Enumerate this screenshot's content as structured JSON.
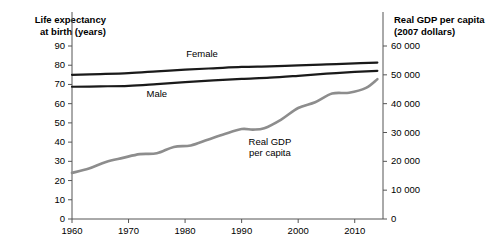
{
  "chart_data": {
    "type": "line",
    "title": "",
    "subtitle": "",
    "xlabel": "",
    "ylabel": "Life expectancy at birth (years)",
    "y2label": "Real GDP per capita (2007 dollars)",
    "xlim": [
      1960,
      2015
    ],
    "ylim": [
      0,
      90
    ],
    "y2lim": [
      0,
      60000
    ],
    "grid": false,
    "legend_position": "inline-annotations",
    "xticks": [
      1960,
      1970,
      1980,
      1990,
      2000,
      2010
    ],
    "xtick_labels": [
      "1960",
      "1970",
      "1980",
      "1990",
      "2000",
      "2010"
    ],
    "yticks": [
      0,
      10,
      20,
      30,
      40,
      50,
      60,
      70,
      80,
      90
    ],
    "ytick_labels": [
      "0",
      "10",
      "20",
      "30",
      "40",
      "50",
      "60",
      "70",
      "80",
      "90"
    ],
    "y2ticks": [
      0,
      10000,
      20000,
      30000,
      40000,
      50000,
      60000
    ],
    "y2tick_labels": [
      "0",
      "10 000",
      "20 000",
      "30 000",
      "40 000",
      "50 000",
      "60 000"
    ],
    "series": [
      {
        "name": "Female",
        "axis": "left",
        "color": "#1a1a1a",
        "width": 2.2,
        "x": [
          1960,
          1965,
          1970,
          1975,
          1980,
          1985,
          1990,
          1995,
          2000,
          2005,
          2010,
          2014
        ],
        "values": [
          75.0,
          75.4,
          75.9,
          76.8,
          77.7,
          78.4,
          79.1,
          79.4,
          79.9,
          80.4,
          81.0,
          81.4
        ]
      },
      {
        "name": "Male",
        "axis": "left",
        "color": "#1a1a1a",
        "width": 2.2,
        "x": [
          1960,
          1965,
          1970,
          1975,
          1980,
          1985,
          1990,
          1995,
          2000,
          2005,
          2010,
          2014
        ],
        "values": [
          68.8,
          69.0,
          69.3,
          70.2,
          71.2,
          72.1,
          72.9,
          73.5,
          74.5,
          75.6,
          76.5,
          77.1
        ]
      },
      {
        "name": "Real GDP per capita",
        "axis": "right",
        "color": "#8d8d8d",
        "width": 2.6,
        "x": [
          1960,
          1963,
          1966,
          1969,
          1972,
          1975,
          1978,
          1981,
          1984,
          1987,
          1990,
          1992,
          1994,
          1997,
          2000,
          2003,
          2006,
          2009,
          2012,
          2014
        ],
        "values": [
          16000,
          17500,
          19800,
          21200,
          22500,
          22800,
          25000,
          25500,
          27500,
          29500,
          31200,
          31000,
          31500,
          34500,
          38500,
          40500,
          43500,
          43800,
          45500,
          48500
        ]
      }
    ],
    "annotations": [
      {
        "name": "female-label",
        "text": "Female",
        "x": 1983,
        "y": 86
      },
      {
        "name": "male-label",
        "text": "Male",
        "x": 1975,
        "y": 65
      },
      {
        "name": "gdp-label",
        "text": "Real GDP\nper capita",
        "x": 1995,
        "y": 40
      }
    ]
  },
  "axes": {
    "left_title": "Life expectancy\nat birth (years)",
    "right_title": "Real GDP per capita\n(2007 dollars)"
  },
  "colors": {
    "life_expectancy_line": "#1a1a1a",
    "gdp_line": "#8d8d8d",
    "axis": "#555555",
    "background": "#ffffff",
    "text": "#000000"
  }
}
